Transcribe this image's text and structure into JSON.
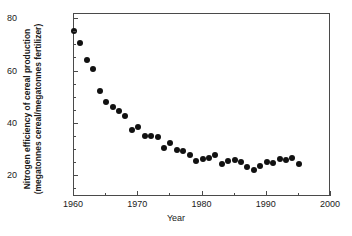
{
  "chart_data": {
    "type": "scatter",
    "title": "",
    "xlabel": "Year",
    "ylabel": "Nitrogen efficiency of cereal production (megatonnes cereal/megatonnes fertilizer)",
    "ylabel_line1": "Nitrogen efficiency of cereal production",
    "ylabel_line2": "(megatonnes cereal/megatonnes fertilizer)",
    "xlim": [
      1960,
      2000
    ],
    "ylim": [
      12,
      82
    ],
    "xticks": [
      1960,
      1970,
      1980,
      1990,
      2000
    ],
    "xtick_labels": [
      "1960",
      "1970",
      "1980",
      "1990",
      "2000"
    ],
    "xminor_ticks": [
      1965,
      1975,
      1985,
      1995
    ],
    "yticks": [
      20,
      40,
      60,
      80
    ],
    "ytick_labels": [
      "20",
      "40",
      "60",
      "80"
    ],
    "yminor_ticks": [
      15,
      25,
      30,
      35,
      45,
      50,
      55,
      65,
      70,
      75
    ],
    "grid": false,
    "legend": null,
    "marker": "filled-circle",
    "marker_color": "#111111",
    "marker_size_px": 6,
    "x": [
      1960,
      1961,
      1962,
      1963,
      1964,
      1965,
      1966,
      1967,
      1968,
      1969,
      1970,
      1971,
      1972,
      1973,
      1974,
      1975,
      1976,
      1977,
      1978,
      1979,
      1980,
      1981,
      1982,
      1983,
      1984,
      1985,
      1986,
      1987,
      1988,
      1989,
      1990,
      1991,
      1992,
      1993,
      1994,
      1995
    ],
    "values": [
      75.5,
      71.0,
      64.5,
      61.0,
      52.5,
      48.5,
      46.5,
      45.0,
      43.0,
      37.5,
      38.8,
      35.2,
      35.2,
      35.0,
      30.8,
      32.5,
      30.0,
      29.5,
      28.0,
      25.8,
      26.5,
      27.0,
      28.0,
      24.5,
      25.8,
      26.2,
      25.2,
      23.5,
      22.2,
      24.0,
      25.2,
      25.0,
      26.5,
      26.2,
      26.8,
      24.5
    ]
  },
  "axis_color": "#4a4a4a",
  "background": "#ffffff"
}
